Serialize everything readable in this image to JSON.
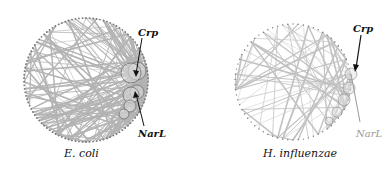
{
  "figure": {
    "panels": [
      {
        "caption": "E. coli",
        "annotations": [
          {
            "label": "Crp",
            "style": "bold"
          },
          {
            "label": "NarL",
            "style": "bold"
          }
        ]
      },
      {
        "caption": "H. influenzae",
        "annotations": [
          {
            "label": "Crp",
            "style": "bold"
          },
          {
            "label": "NarL",
            "style": "grey"
          }
        ]
      }
    ],
    "colors": {
      "edge": "#9a9a9a",
      "node": "#777777",
      "hub_fill": "#cfcfcf",
      "arrow": "#111111"
    },
    "layout": "circular network"
  }
}
